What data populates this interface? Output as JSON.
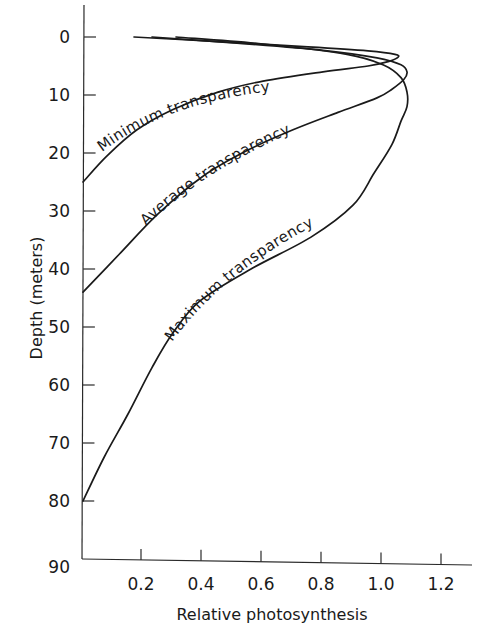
{
  "chart_data": {
    "type": "line",
    "title": "",
    "xlabel": "Relative photosynthesis",
    "ylabel": "Depth (meters)",
    "xlim": [
      0,
      1.3
    ],
    "ylim": [
      0,
      90
    ],
    "y_inverted": true,
    "grid": false,
    "legend": "inline labels along curves",
    "x_ticks": [
      0.2,
      0.4,
      0.6,
      0.8,
      1.0,
      1.2
    ],
    "x_tick_labels": [
      "0.2",
      "0.4",
      "0.6",
      "0.8",
      "1.0",
      "1.2"
    ],
    "y_ticks": [
      0,
      10,
      20,
      30,
      40,
      50,
      60,
      70,
      80,
      90
    ],
    "y_tick_labels": [
      "0",
      "10",
      "20",
      "30",
      "40",
      "50",
      "60",
      "70",
      "80",
      "90"
    ],
    "series": [
      {
        "name": "Minimum transparency",
        "points": [
          [
            0.17,
            0
          ],
          [
            0.45,
            0.8
          ],
          [
            0.75,
            1.7
          ],
          [
            0.95,
            2.4
          ],
          [
            1.04,
            3.0
          ],
          [
            1.05,
            3.5
          ],
          [
            1.02,
            4.2
          ],
          [
            0.95,
            5.0
          ],
          [
            0.8,
            6.0
          ],
          [
            0.6,
            7.6
          ],
          [
            0.45,
            9.5
          ],
          [
            0.3,
            12.5
          ],
          [
            0.18,
            16
          ],
          [
            0.08,
            20.5
          ],
          [
            0.0,
            25
          ]
        ]
      },
      {
        "name": "Average transparency",
        "points": [
          [
            0.23,
            0
          ],
          [
            0.5,
            1.0
          ],
          [
            0.8,
            2.3
          ],
          [
            0.98,
            3.6
          ],
          [
            1.06,
            4.8
          ],
          [
            1.08,
            6.0
          ],
          [
            1.07,
            7.3
          ],
          [
            1.03,
            9.0
          ],
          [
            0.98,
            10.5
          ],
          [
            0.85,
            13.0
          ],
          [
            0.7,
            16.0
          ],
          [
            0.55,
            19.5
          ],
          [
            0.4,
            24.0
          ],
          [
            0.25,
            30.5
          ],
          [
            0.12,
            37.5
          ],
          [
            0.0,
            44
          ]
        ]
      },
      {
        "name": "Maximum transparency",
        "points": [
          [
            0.31,
            0
          ],
          [
            0.6,
            1.2
          ],
          [
            0.88,
            3.0
          ],
          [
            1.0,
            4.8
          ],
          [
            1.06,
            7.0
          ],
          [
            1.08,
            9.5
          ],
          [
            1.08,
            12.0
          ],
          [
            1.06,
            14.5
          ],
          [
            1.03,
            18.5
          ],
          [
            0.97,
            23.5
          ],
          [
            0.9,
            29.0
          ],
          [
            0.76,
            34.5
          ],
          [
            0.56,
            40.0
          ],
          [
            0.39,
            45.5
          ],
          [
            0.3,
            51.0
          ],
          [
            0.23,
            57.0
          ],
          [
            0.15,
            65.0
          ],
          [
            0.07,
            72.5
          ],
          [
            0.0,
            80
          ]
        ]
      }
    ]
  },
  "labels": {
    "min": "Minimum transparency",
    "avg": "Average transparency",
    "max": "Maximum transparency",
    "xlabel": "Relative photosynthesis",
    "ylabel": "Depth (meters)"
  }
}
